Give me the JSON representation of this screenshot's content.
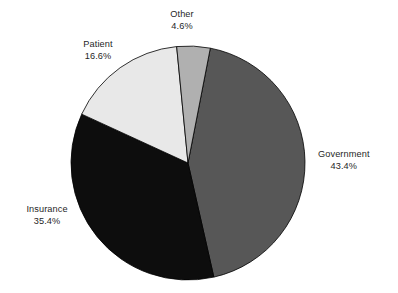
{
  "chart_data": {
    "type": "pie",
    "title": "",
    "subtitle": "",
    "xlabel": "",
    "ylabel": "",
    "grid": false,
    "legend_position": "outside-labels",
    "units": "percent",
    "start_angle_deg_from_top": 11,
    "direction": "clockwise",
    "categories": [
      "Government",
      "Insurance",
      "Patient",
      "Other"
    ],
    "values": [
      43.4,
      35.4,
      16.6,
      4.6
    ],
    "labels": [
      "43.4%",
      "35.4%",
      "16.6%",
      "4.6%"
    ],
    "colors": [
      "#575757",
      "#0d0d0d",
      "#e8e8e8",
      "#b0b0b0"
    ],
    "slices": [
      {
        "name": "Government",
        "value": 43.4,
        "value_label": "43.4%",
        "color": "#575757"
      },
      {
        "name": "Insurance",
        "value": 35.4,
        "value_label": "35.4%",
        "color": "#0d0d0d"
      },
      {
        "name": "Patient",
        "value": 16.6,
        "value_label": "16.6%",
        "color": "#e8e8e8"
      },
      {
        "name": "Other",
        "value": 4.6,
        "value_label": "4.6%",
        "color": "#b0b0b0"
      }
    ],
    "total": 100.0,
    "geometry": {
      "center_x": 188,
      "center_y": 163,
      "radius": 117,
      "stroke_color": "#000000",
      "stroke_width": 0.8,
      "background": "#ffffff"
    }
  }
}
